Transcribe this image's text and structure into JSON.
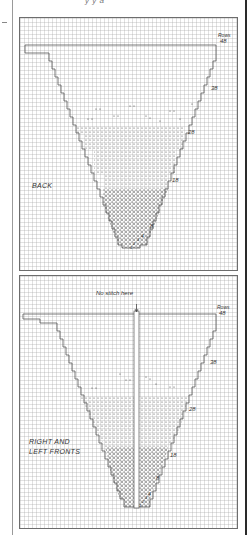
{
  "header": {
    "partial_text": "y y  a"
  },
  "panels": [
    {
      "name": "BACK",
      "label": "BACK",
      "rows_heading": "Rows",
      "row_markers": [
        "48",
        "38",
        "28",
        "18",
        "8",
        "4",
        "3",
        "2",
        "1"
      ]
    },
    {
      "name": "RIGHT AND LEFT FRONTS",
      "label_line1": "RIGHT AND",
      "label_line2": "LEFT FRONTS",
      "annotation": "No stitch here",
      "rows_heading": "Rows",
      "row_markers": [
        "48",
        "38",
        "28",
        "18",
        "8",
        "4",
        "3",
        "2",
        "1"
      ]
    }
  ],
  "colors": {
    "grid": "#aaaaaa",
    "outline": "#555555",
    "rule": "#2a2a2a"
  }
}
